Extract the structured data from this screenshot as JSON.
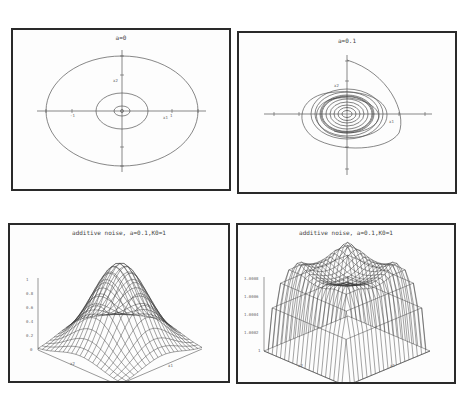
{
  "chart_data": [
    {
      "type": "line",
      "title": "a=0",
      "xlabel": "x1",
      "ylabel": "x2",
      "xlim": [
        -1.5,
        1.5
      ],
      "ylim": [
        -1.5,
        1.5
      ],
      "xticks": [
        "-1",
        "-0.5",
        "0.5",
        "1"
      ],
      "yticks": [
        "1",
        "0.5",
        "-0.5",
        "-1"
      ],
      "grid": false,
      "description": "Phase portrait: three concentric closed orbits (ellipses) around origin",
      "series": [
        {
          "name": "orbit-large",
          "rx": 1.5,
          "ry": 1.0
        },
        {
          "name": "orbit-medium",
          "rx": 0.5,
          "ry": 0.35
        },
        {
          "name": "orbit-small",
          "rx": 0.15,
          "ry": 0.1
        }
      ]
    },
    {
      "type": "line",
      "title": "a=0.1",
      "xlabel": "x1",
      "ylabel": "x2",
      "xlim": [
        -1.5,
        1.5
      ],
      "ylim": [
        -1.5,
        1.5
      ],
      "xticks": [
        "-1",
        "-0.5",
        "0.5",
        "1"
      ],
      "yticks": [
        "1",
        "0.5",
        "-0.5",
        "-1"
      ],
      "grid": false,
      "description": "Phase portrait: trajectory starting near (0,1) spiraling inward to a dense set of nested orbits around origin",
      "series": [
        {
          "name": "spiral-trajectory",
          "start": [
            0,
            1.0
          ],
          "limit_rx": 0.5,
          "limit_ry": 0.38
        }
      ]
    },
    {
      "type": "surface",
      "title": "additive noise, a=0.1,K0=1",
      "xlabel": "x1",
      "ylabel": "x2",
      "zlabel": "",
      "zticks": [
        "0",
        "0.2",
        "0.4",
        "0.6",
        "0.8",
        "1"
      ],
      "xticks": [
        "-1",
        "-0.5",
        "0",
        "0.5",
        "1"
      ],
      "yticks": [
        "-1",
        "-0.5",
        "0",
        "0.5",
        "1"
      ],
      "zlim": [
        0,
        1
      ],
      "description": "Wireframe surface: Gaussian-like bump peaking at center"
    },
    {
      "type": "surface",
      "title": "additive noise, a=0.1,K0=1",
      "xlabel": "x1",
      "ylabel": "x2",
      "zticks": [
        "1",
        "1.0002",
        "1.0004",
        "1.0006",
        "1.0008"
      ],
      "xticks": [
        "-1",
        "-0.5",
        "0",
        "0.5",
        "1"
      ],
      "yticks": [
        "-1",
        "-0.5",
        "0",
        "0.5",
        "1"
      ],
      "zlim": [
        1,
        1.0008
      ],
      "description": "Wireframe surface: bowl/crater shape, high ring with dip at center, low at corners"
    }
  ],
  "panels": {
    "tl": {
      "title": "a=0",
      "xlabel": "x1",
      "ylabel": "x2"
    },
    "tr": {
      "title": "a=0.1",
      "xlabel": "x1",
      "ylabel": "x2"
    },
    "bl": {
      "title": "additive noise, a=0.1,K0=1",
      "xlabel": "x1",
      "ylabel": "x2",
      "zticks": [
        "1",
        "0.8",
        "0.6",
        "0.4",
        "0.2",
        "0"
      ]
    },
    "br": {
      "title": "additive noise, a=0.1,K0=1",
      "xlabel": "x1",
      "ylabel": "x2",
      "zticks": [
        "1.0008",
        "1.0006",
        "1.0004",
        "1.0002",
        "1"
      ]
    }
  }
}
